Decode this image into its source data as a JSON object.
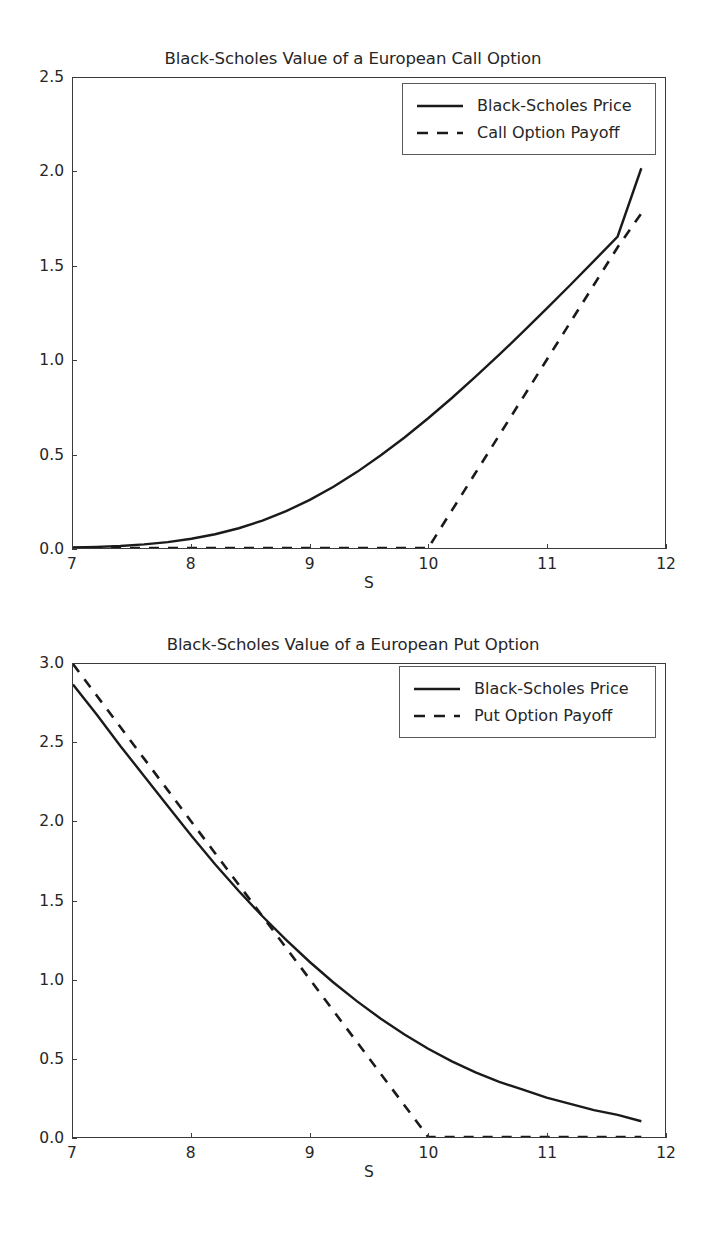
{
  "page": {
    "background_color": "#ffffff",
    "foreground_color": "#262626",
    "axis_color": "#3b3b3b"
  },
  "charts": [
    {
      "id": "call",
      "title": "Black-Scholes Value of a European Call Option",
      "xlabel": "S",
      "ylabel": "",
      "xticks": [
        "7",
        "8",
        "9",
        "10",
        "11",
        "12"
      ],
      "yticks": [
        "0.0",
        "0.5",
        "1.0",
        "1.5",
        "2.0",
        "2.5"
      ],
      "legend": [
        {
          "label": "Black-Scholes Price",
          "style": "solid"
        },
        {
          "label": "Call Option Payoff",
          "style": "dashed"
        }
      ]
    },
    {
      "id": "put",
      "title": "Black-Scholes Value of a European Put Option",
      "xlabel": "S",
      "ylabel": "",
      "xticks": [
        "7",
        "8",
        "9",
        "10",
        "11",
        "12"
      ],
      "yticks": [
        "0.0",
        "0.5",
        "1.0",
        "1.5",
        "2.0",
        "2.5",
        "3.0"
      ],
      "legend": [
        {
          "label": "Black-Scholes Price",
          "style": "solid"
        },
        {
          "label": "Put Option Payoff",
          "style": "dashed"
        }
      ]
    }
  ],
  "chart_data": [
    {
      "type": "line",
      "title": "Black-Scholes Value of a European Call Option",
      "xlabel": "S",
      "ylabel": "",
      "xlim": [
        7,
        12
      ],
      "ylim": [
        0.0,
        2.5
      ],
      "grid": false,
      "legend_position": "upper right",
      "x": [
        7.0,
        7.2,
        7.4,
        7.6,
        7.8,
        8.0,
        8.2,
        8.4,
        8.6,
        8.8,
        9.0,
        9.2,
        9.4,
        9.6,
        9.8,
        10.0,
        10.2,
        10.4,
        10.6,
        10.8,
        11.0,
        11.2,
        11.4,
        11.6,
        11.8
      ],
      "series": [
        {
          "name": "Black-Scholes Price",
          "style": "solid",
          "values": [
            0.003,
            0.006,
            0.011,
            0.019,
            0.031,
            0.049,
            0.073,
            0.105,
            0.146,
            0.196,
            0.256,
            0.326,
            0.405,
            0.493,
            0.588,
            0.69,
            0.798,
            0.911,
            1.028,
            1.149,
            1.273,
            1.399,
            1.527,
            1.657,
            2.02
          ]
        },
        {
          "name": "Call Option Payoff",
          "style": "dashed",
          "values": [
            0.0,
            0.0,
            0.0,
            0.0,
            0.0,
            0.0,
            0.0,
            0.0,
            0.0,
            0.0,
            0.0,
            0.0,
            0.0,
            0.0,
            0.0,
            0.0,
            0.2,
            0.4,
            0.6,
            0.8,
            1.0,
            1.2,
            1.4,
            1.6,
            1.78
          ]
        }
      ],
      "annotations": [
        "Strike at S = 10",
        "Payoff is max(S - 10, 0)"
      ]
    },
    {
      "type": "line",
      "title": "Black-Scholes Value of a European Put Option",
      "xlabel": "S",
      "ylabel": "",
      "xlim": [
        7,
        12
      ],
      "ylim": [
        0.0,
        3.0
      ],
      "grid": false,
      "legend_position": "upper right",
      "x": [
        7.0,
        7.2,
        7.4,
        7.6,
        7.8,
        8.0,
        8.2,
        8.4,
        8.6,
        8.8,
        9.0,
        9.2,
        9.4,
        9.6,
        9.8,
        10.0,
        10.2,
        10.4,
        10.6,
        10.8,
        11.0,
        11.2,
        11.4,
        11.6,
        11.8
      ],
      "series": [
        {
          "name": "Black-Scholes Price",
          "style": "solid",
          "values": [
            2.87,
            2.68,
            2.48,
            2.29,
            2.1,
            1.91,
            1.73,
            1.56,
            1.4,
            1.25,
            1.11,
            0.98,
            0.86,
            0.75,
            0.65,
            0.56,
            0.48,
            0.41,
            0.35,
            0.3,
            0.25,
            0.21,
            0.17,
            0.14,
            0.1
          ]
        },
        {
          "name": "Put Option Payoff",
          "style": "dashed",
          "values": [
            3.0,
            2.8,
            2.6,
            2.4,
            2.2,
            2.0,
            1.8,
            1.6,
            1.4,
            1.2,
            1.0,
            0.8,
            0.6,
            0.4,
            0.2,
            0.0,
            0.0,
            0.0,
            0.0,
            0.0,
            0.0,
            0.0,
            0.0,
            0.0,
            0.0
          ]
        }
      ],
      "annotations": [
        "Strike at S = 10",
        "Payoff is max(10 - S, 0)"
      ]
    }
  ]
}
